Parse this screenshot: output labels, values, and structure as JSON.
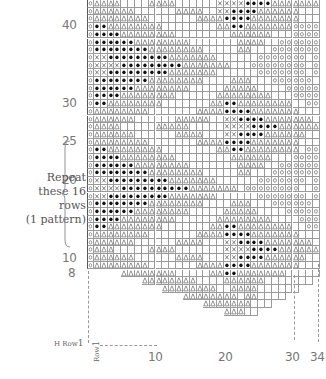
{
  "chart_data": {
    "type": "table",
    "grid": {
      "columns": 34,
      "legend_symbols": {
        ".": "empty",
        "o": "circle",
        "b": "filled-dot",
        "x": "cross",
        "t": "triangle",
        "-": "no-stitch"
      },
      "rows_top_to_bottom": [
        "otttt....tttt......xxxxbbbbttttttto",
        "otttttt......tttt..xxbbbbtttttt...o",
        "otttttttt.......ttttbbbbttttttt...o",
        "obbtttttttt........ttbbtttttttoooo",
        "obbbbtttttttt........tttttt...ooooo",
        "obbbbbbtttttttt.......tttt..oooooo",
        "obbbbbbbbtttttttt.....tt...ooooooo",
        "oxxbbbbbbbbbttttttt......ooooooo.o",
        "oxxxxbbbbbbbbbttttttt...oooooooo.o",
        "oxxbbbbbbbbbttttttt......ooooooo.o",
        "obbbbbbbbtttttttt....ttt...oooooo.o",
        "obbbbbbtttttttt.....ttttt....ooooo",
        "obbbbtttttttt......tttttttt...ooooo",
        "obbtttttttt.......ttbbtttttttt..ooo",
        "otttttttt.......ttttbbbbttttttt...o",
        "otttttt......ttttt..xxbbbbttttttt.o",
        "otttt.....ttttt.....xxxxbbbbttttttto",
        "otttttt......tttt...xxbbbbtttttt..o",
        "otttttttt.......ttttbbbbttttttt...o",
        "obbtttttttt........ttbbtttttttt.ooo",
        "obbbbtttttttt........tttttt...ooooo",
        "obbbbbbtttttttt.......tttt..oooooo",
        "obbbbbbbbtttttttt.....tt...ooooooo",
        "oxxbbbbbbbbbttttttt......ooooooo.o",
        "oxxxxbbbbbbbbbbttttttt.oooooooo..o",
        "oxxbbbbbbbbbttttttt......ooooooo.o",
        "obbbbbbbbtttttttt....ttt...oooooo.o",
        "obbbbbbtttttttt.....ttttt....ooooo",
        "obbbbtttttttt......tttttttt....oooo",
        "obbtttttttt.......ttbbtttttttt..ooo",
        "otttttttt.......ttttbbbbttttttt...o",
        "otttttt......tttt...xxbbbbttttttt.o",
        "ottt.....tttt.......xxxxbbbbtttttto",
        "otttttt......tttt...xxbbbbtttttt..o",
        "otttttttt.......ttttbbbbttttttt...o",
        "-----tttttttt.....ttbbttttttt......",
        "--------tttttttt....tttttt.......--",
        "-----------tttttttt..tttt......----",
        "--------------tttttttt.tt....------",
        "-----------------ttttttt...--------",
        "--------------------ttt..----------"
      ],
      "row_labels": [
        {
          "label": "40",
          "row": 40
        },
        {
          "label": "30",
          "row": 30
        },
        {
          "label": "25",
          "row": 25
        },
        {
          "label": "20",
          "row": 20
        },
        {
          "label": "10",
          "row": 10
        },
        {
          "label": "8",
          "row": 8
        }
      ],
      "col_labels": [
        {
          "label": "10",
          "col": 10
        },
        {
          "label": "20",
          "col": 20
        },
        {
          "label": "30",
          "col": 30
        },
        {
          "label": "34",
          "col": 34
        }
      ]
    },
    "annotations": {
      "repeat_lines": [
        "Repeat",
        "these 16",
        "rows",
        "(1 pattern)"
      ],
      "h_row": "H Row",
      "h_row_num": "1",
      "row_marker": "Row",
      "row_marker_num": "1"
    }
  }
}
